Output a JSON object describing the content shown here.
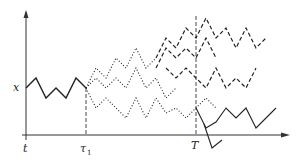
{
  "diagram": {
    "type": "stochastic-path-branching",
    "labels": {
      "x_axis_origin": "t",
      "tau": "τ",
      "tau_sub": "1",
      "T": "T",
      "y_value": "x"
    },
    "colors": {
      "axis": "#333333",
      "path": "#222222"
    },
    "paths": {
      "initial_solid": [
        [
          26,
          88
        ],
        [
          36,
          78
        ],
        [
          46,
          98
        ],
        [
          56,
          88
        ],
        [
          66,
          98
        ],
        [
          76,
          78
        ],
        [
          86,
          88
        ]
      ],
      "dotted": [
        [
          [
            86,
            88
          ],
          [
            96,
            68
          ],
          [
            106,
            78
          ],
          [
            116,
            58
          ],
          [
            126,
            68
          ],
          [
            136,
            48
          ],
          [
            146,
            68
          ],
          [
            156,
            58
          ]
        ],
        [
          [
            86,
            88
          ],
          [
            96,
            78
          ],
          [
            106,
            88
          ],
          [
            116,
            78
          ],
          [
            126,
            88
          ],
          [
            136,
            68
          ],
          [
            146,
            88
          ],
          [
            156,
            78
          ],
          [
            166,
            98
          ],
          [
            176,
            88
          ]
        ],
        [
          [
            86,
            88
          ],
          [
            96,
            108
          ],
          [
            106,
            98
          ],
          [
            116,
            108
          ],
          [
            126,
            118
          ],
          [
            136,
            98
          ],
          [
            146,
            118
          ],
          [
            156,
            98
          ],
          [
            166,
            113
          ],
          [
            176,
            108
          ],
          [
            186,
            118
          ],
          [
            196,
            108
          ],
          [
            206,
            98
          ],
          [
            216,
            108
          ]
        ]
      ],
      "dashed": [
        [
          [
            156,
            58
          ],
          [
            166,
            38
          ],
          [
            176,
            48
          ],
          [
            186,
            28
          ],
          [
            196,
            38
          ],
          [
            206,
            18
          ],
          [
            216,
            38
          ],
          [
            226,
            28
          ],
          [
            236,
            48
          ],
          [
            246,
            28
          ],
          [
            256,
            48
          ],
          [
            266,
            38
          ]
        ],
        [
          [
            156,
            68
          ],
          [
            166,
            48
          ],
          [
            176,
            58
          ],
          [
            186,
            48
          ],
          [
            196,
            58
          ],
          [
            206,
            38
          ],
          [
            216,
            58
          ]
        ],
        [
          [
            166,
            68
          ],
          [
            176,
            78
          ],
          [
            186,
            68
          ],
          [
            196,
            78
          ],
          [
            206,
            88
          ],
          [
            216,
            68
          ],
          [
            226,
            88
          ],
          [
            236,
            78
          ],
          [
            246,
            88
          ],
          [
            256,
            68
          ]
        ]
      ],
      "final_solid": [
        [
          [
            216,
            108
          ],
          [
            226,
            128
          ],
          [
            236,
            122
          ],
          [
            246,
            138
          ],
          [
            256,
            128
          ],
          [
            266,
            108
          ],
          [
            276,
            118
          ],
          [
            286,
            108
          ],
          [
            296,
            128
          ],
          [
            306,
            118
          ]
        ],
        [
          [
            226,
            128
          ],
          [
            236,
            148
          ],
          [
            246,
            138
          ]
        ]
      ]
    },
    "markers": {
      "tau_x": 86,
      "T_x": 196,
      "x_level_y": 88,
      "axis_y": 135,
      "axis_origin_x": 26
    }
  }
}
